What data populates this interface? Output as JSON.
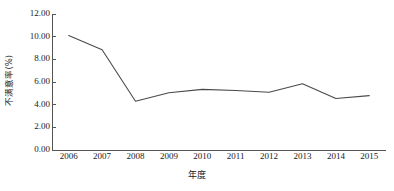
{
  "chart_data": {
    "type": "line",
    "title": "",
    "xlabel": "年度",
    "ylabel": "不满意率(%)",
    "categories": [
      "2006",
      "2007",
      "2008",
      "2009",
      "2010",
      "2011",
      "2012",
      "2013",
      "2014",
      "2015"
    ],
    "values": [
      10.1,
      8.85,
      4.3,
      5.05,
      5.35,
      5.25,
      5.1,
      5.85,
      4.55,
      4.8
    ],
    "series": [
      {
        "name": "不满意率(%)",
        "values": [
          10.1,
          8.85,
          4.3,
          5.05,
          5.35,
          5.25,
          5.1,
          5.85,
          4.55,
          4.8
        ]
      }
    ],
    "ylim": [
      0.0,
      12.0
    ],
    "ytick_labels": [
      "12.00",
      "10.00",
      "8.00",
      "6.00",
      "4.00",
      "2.00",
      "0.00"
    ],
    "ytick_values": [
      12.0,
      10.0,
      8.0,
      6.0,
      4.0,
      2.0,
      0.0
    ],
    "xtick_labels": [
      "2006",
      "2007",
      "2008",
      "2009",
      "2010",
      "2011",
      "2012",
      "2013",
      "2014",
      "2015"
    ],
    "grid": false,
    "legend": false,
    "legend_position": "none",
    "line_color": "#4a4a4a",
    "axis_color": "#555555",
    "background_color": "#ffffff"
  }
}
